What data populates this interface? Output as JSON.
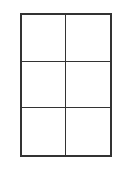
{
  "grid": {
    "rows": 3,
    "columns": 2,
    "line_color": "#333333",
    "cells": [
      {
        "row": 1,
        "col": 1,
        "content": ""
      },
      {
        "row": 1,
        "col": 2,
        "content": ""
      },
      {
        "row": 2,
        "col": 1,
        "content": ""
      },
      {
        "row": 2,
        "col": 2,
        "content": ""
      },
      {
        "row": 3,
        "col": 1,
        "content": ""
      },
      {
        "row": 3,
        "col": 2,
        "content": ""
      }
    ]
  }
}
